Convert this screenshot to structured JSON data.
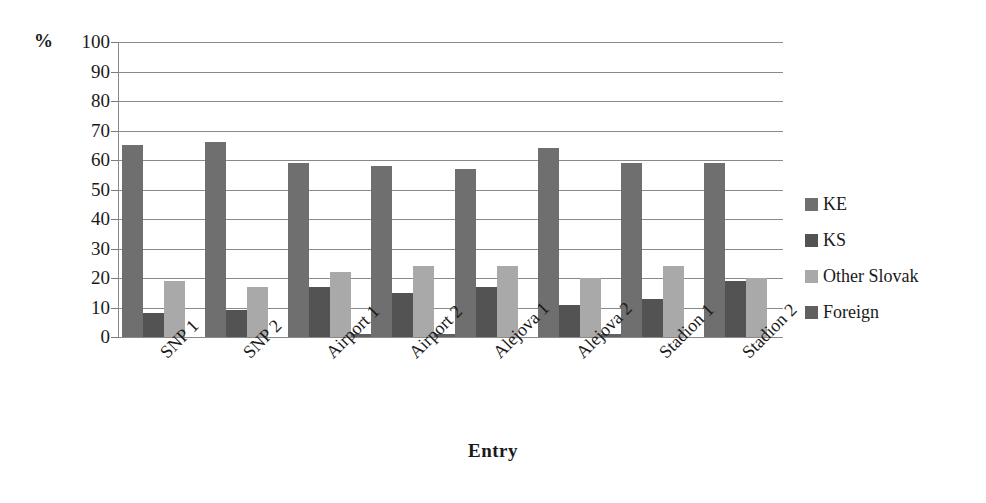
{
  "chart_data": {
    "type": "bar",
    "title": "",
    "xlabel": "Entry",
    "ylabel": "%",
    "ylim": [
      0,
      100
    ],
    "ytick_step": 10,
    "yticks": [
      100,
      90,
      80,
      70,
      60,
      50,
      40,
      30,
      20,
      10,
      0
    ],
    "grid": true,
    "legend_position": "right",
    "categories": [
      "SNP 1",
      "SNP 2",
      "Airport 1",
      "Airport 2",
      "Alejova 1",
      "Alejova 2",
      "Stadion 1",
      "Stadion 2"
    ],
    "series": [
      {
        "name": "KE",
        "color": "#6f6f6f",
        "values": [
          65,
          66,
          59,
          58,
          57,
          64,
          59,
          59
        ]
      },
      {
        "name": "KS",
        "color": "#535353",
        "values": [
          8,
          9,
          17,
          15,
          17,
          11,
          13,
          19
        ]
      },
      {
        "name": "Other Slovak",
        "color": "#a9a9a9",
        "values": [
          19,
          17,
          22,
          24,
          24,
          20,
          24,
          20
        ]
      },
      {
        "name": "Foreign",
        "color": "#606060",
        "values": [
          0,
          0,
          1,
          1,
          0,
          1,
          0,
          0
        ]
      }
    ]
  },
  "axis": {
    "unit_label": "%",
    "x_title": "Entry"
  },
  "legend": {
    "items": [
      {
        "label": "KE",
        "color": "#6f6f6f"
      },
      {
        "label": "KS",
        "color": "#535353"
      },
      {
        "label": "Other Slovak",
        "color": "#a9a9a9"
      },
      {
        "label": "Foreign",
        "color": "#606060"
      }
    ]
  }
}
